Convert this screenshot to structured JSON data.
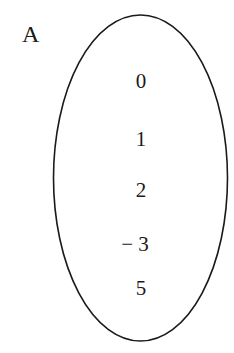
{
  "diagram": {
    "set_name": "A",
    "elements": [
      "0",
      "1",
      "2",
      "− 3",
      "5"
    ],
    "shape": {
      "type": "ellipse",
      "cx": 140.5,
      "cy": 178,
      "rx": 87,
      "ry": 163,
      "stroke": "#1a1a1a"
    }
  }
}
